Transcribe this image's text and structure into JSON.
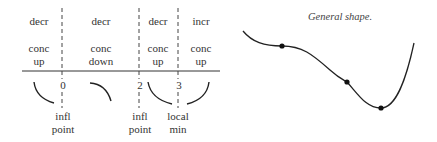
{
  "sign_chart": {
    "intervals": [
      {
        "monotonic": "decr",
        "concavity_1": "conc",
        "concavity_2": "up"
      },
      {
        "monotonic": "decr",
        "concavity_1": "conc",
        "concavity_2": "down"
      },
      {
        "monotonic": "decr",
        "concavity_1": "conc",
        "concavity_2": "up"
      },
      {
        "monotonic": "incr",
        "concavity_1": "conc",
        "concavity_2": "up"
      }
    ],
    "critical_points": [
      {
        "x": "0",
        "note_1": "infl",
        "note_2": "point"
      },
      {
        "x": "2",
        "note_1": "infl",
        "note_2": "point"
      },
      {
        "x": "3",
        "note_1": "local",
        "note_2": "min"
      }
    ]
  },
  "graph": {
    "title": "General shape.",
    "line_color": "#222222"
  }
}
